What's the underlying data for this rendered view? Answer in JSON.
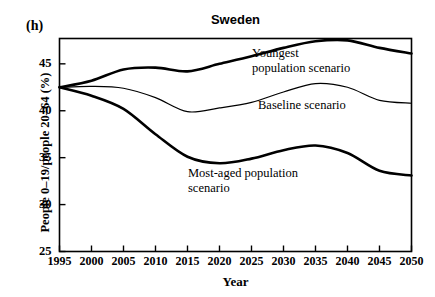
{
  "panel": {
    "label": "(h)"
  },
  "chart_data": {
    "type": "line",
    "title": "Sweden",
    "xlabel": "Year",
    "ylabel": "People 0–19/people 20–64 (%)",
    "xlim": [
      1995,
      2050
    ],
    "ylim": [
      25,
      47.7
    ],
    "yticks": [
      25,
      30,
      35,
      40,
      45
    ],
    "xticks": [
      1995,
      2000,
      2005,
      2010,
      2015,
      2020,
      2025,
      2030,
      2035,
      2040,
      2045,
      2050
    ],
    "grid": false,
    "legend": "annotations-on-curves",
    "x": [
      1995,
      2000,
      2005,
      2010,
      2015,
      2020,
      2025,
      2030,
      2035,
      2040,
      2045,
      2050
    ],
    "series": [
      {
        "name": "Youngest population scenario",
        "label_lines": [
          "Youngest",
          "population scenario"
        ],
        "style": "thick",
        "color": "#000000",
        "values": [
          42.5,
          43.2,
          44.4,
          44.6,
          44.2,
          45.0,
          45.8,
          46.7,
          47.4,
          47.5,
          46.7,
          46.1
        ]
      },
      {
        "name": "Baseline scenario",
        "label_lines": [
          "Baseline scenario"
        ],
        "style": "thin",
        "color": "#000000",
        "values": [
          42.5,
          42.6,
          42.4,
          41.4,
          39.9,
          40.3,
          40.9,
          42.0,
          42.9,
          42.5,
          41.1,
          40.8
        ]
      },
      {
        "name": "Most-aged population scenario",
        "label_lines": [
          "Most-aged population",
          "scenario"
        ],
        "style": "thick",
        "color": "#000000",
        "values": [
          42.5,
          41.6,
          40.2,
          37.5,
          35.1,
          34.4,
          34.9,
          35.8,
          36.3,
          35.5,
          33.6,
          33.1
        ]
      }
    ]
  }
}
